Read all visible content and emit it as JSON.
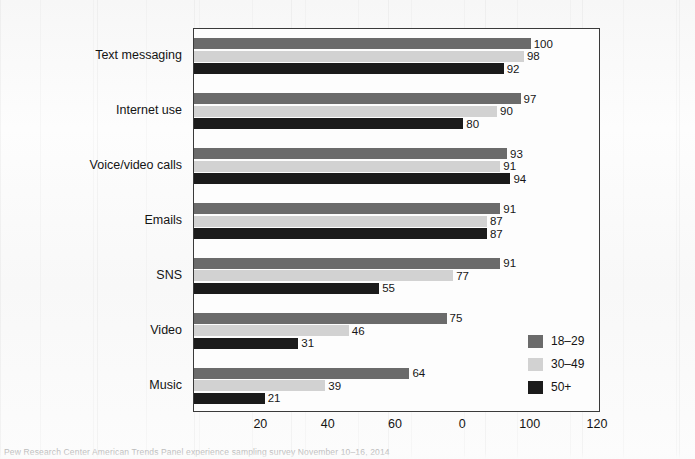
{
  "chart_data": {
    "type": "bar",
    "orientation": "horizontal",
    "title": "",
    "subtitle": "",
    "xlabel": "",
    "ylabel": "",
    "xlim": [
      0,
      120
    ],
    "ylim": null,
    "grid": false,
    "legend_position": "inside-bottom-right",
    "categories": [
      "Text messaging",
      "Internet use",
      "Voice/video calls",
      "Emails",
      "SNS",
      "Video",
      "Music"
    ],
    "series": [
      {
        "name": "18–29",
        "color": "#6b6b6b",
        "values": [
          100,
          97,
          93,
          91,
          91,
          75,
          64
        ]
      },
      {
        "name": "30–49",
        "color": "#d2d2d2",
        "values": [
          98,
          90,
          91,
          87,
          77,
          46,
          39
        ]
      },
      {
        "name": "50+",
        "color": "#1b1b1b",
        "values": [
          92,
          80,
          94,
          87,
          55,
          31,
          21
        ]
      }
    ],
    "x_ticks": [
      20,
      40,
      60,
      80,
      100,
      120
    ],
    "x_tick_labels": [
      "20",
      "40",
      "60",
      "0",
      "100",
      "120"
    ],
    "data_labels": true
  },
  "legend": {
    "entries": [
      {
        "label": "18–29",
        "color": "#6b6b6b"
      },
      {
        "label": "30–49",
        "color": "#d2d2d2"
      },
      {
        "label": "50+",
        "color": "#1b1b1b"
      }
    ]
  },
  "caption": {
    "text": "Pew Research Center American Trends Panel experience sampling survey November 10–16, 2014"
  },
  "colors": {
    "frame": "#3a3a3a",
    "background": "#fbfbfb",
    "text": "#141414"
  }
}
